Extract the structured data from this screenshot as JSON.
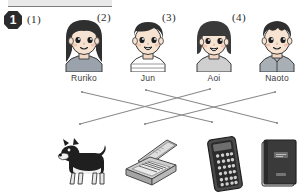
{
  "page": {
    "width": 297,
    "height": 195,
    "background": "#ffffff",
    "ink": "#2b2b2b",
    "line_color": "#8a8a8a"
  },
  "header": {
    "question_number": "1",
    "top_bar_visible": true
  },
  "items": [
    {
      "label": "(1)",
      "x": 27,
      "y": 13
    },
    {
      "label": "(2)",
      "x": 97,
      "y": 11
    },
    {
      "label": "(3)",
      "x": 162,
      "y": 11
    },
    {
      "label": "(4)",
      "x": 232,
      "y": 11
    }
  ],
  "people": [
    {
      "name": "Ruriko",
      "x": 56,
      "hair": "long-dark-hair",
      "hair_color": "#2f2f2f",
      "skin_color": "#f7e3d2",
      "shirt_color": "#9aa3ab",
      "mouth": "smile-closed",
      "gender_cue": "girl"
    },
    {
      "name": "Jun",
      "x": 120,
      "hair": "short-dark-hair",
      "hair_color": "#2f2f2f",
      "skin_color": "#f7e3d2",
      "shirt_color": "#ffffff",
      "mouth": "smile-open",
      "gender_cue": "boy"
    },
    {
      "name": "Aoi",
      "x": 186,
      "hair": "bob-with-bangs",
      "hair_color": "#3a3a3a",
      "skin_color": "#f7e3d2",
      "shirt_color": "#cfcfcf",
      "mouth": "smile-open",
      "gender_cue": "girl"
    },
    {
      "name": "Naoto",
      "x": 249,
      "hair": "short-spiky-hair",
      "hair_color": "#2f2f2f",
      "skin_color": "#f7e3d2",
      "shirt_color": "#a8b0b6",
      "mouth": "smile-closed",
      "gender_cue": "boy"
    }
  ],
  "objects": [
    {
      "name": "dog",
      "icon": "dog-icon",
      "x": 55,
      "color": "#262626"
    },
    {
      "name": "pencil case",
      "icon": "pencil-case-icon",
      "x": 120,
      "color": "#8d8d8d"
    },
    {
      "name": "calculator",
      "icon": "calculator-icon",
      "x": 194,
      "color": "#3b3b3b"
    },
    {
      "name": "notebook",
      "icon": "notebook-icon",
      "x": 250,
      "color": "#333333"
    }
  ],
  "connections": [
    {
      "from": "Ruriko",
      "to": "calculator",
      "x1": 82,
      "y1": 92,
      "x2": 212,
      "y2": 122
    },
    {
      "from": "Jun",
      "to": "notebook",
      "x1": 146,
      "y1": 90,
      "x2": 277,
      "y2": 123
    },
    {
      "from": "Aoi",
      "to": "dog",
      "x1": 210,
      "y1": 89,
      "x2": 80,
      "y2": 124
    },
    {
      "from": "Naoto",
      "to": "pencil case",
      "x1": 275,
      "y1": 92,
      "x2": 145,
      "y2": 124
    }
  ]
}
